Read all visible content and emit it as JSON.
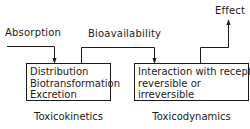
{
  "diagram": {
    "inputs": {
      "absorption": "Absorption",
      "bioavailability": "Bioavailability",
      "effect": "Effect"
    },
    "boxes": [
      {
        "id": "toxicokinetics",
        "lines": [
          "Distribution",
          "Biotransformation",
          "Excretion"
        ],
        "caption": "Toxicokinetics"
      },
      {
        "id": "toxicodynamics",
        "lines": [
          "Interaction with receptor,",
          "reversible or",
          "irreversible"
        ],
        "caption": "Toxicodynamics"
      }
    ],
    "edges": [
      {
        "from": "Absorption",
        "to": "toxicokinetics"
      },
      {
        "from": "toxicokinetics",
        "to": "toxicodynamics",
        "label": "Bioavailability"
      },
      {
        "from": "toxicodynamics",
        "to": "Effect"
      }
    ],
    "colors": {
      "line": "#1a1a1a",
      "background": "#ffffff"
    }
  }
}
